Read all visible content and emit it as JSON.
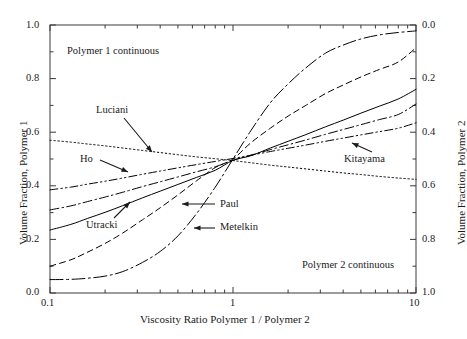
{
  "chart_data": {
    "type": "line",
    "title": "",
    "xlabel": "Viscosity Ratio Polymer 1 / Polymer 2",
    "ylabel": "Volume Fraction, Polymer 1",
    "y2label": "Volume Fraction, Polymer 2",
    "xscale": "log",
    "xlim": [
      0.1,
      10
    ],
    "ylim": [
      0.0,
      1.0
    ],
    "y2lim": [
      1.0,
      0.0
    ],
    "grid": false,
    "legend_position": "inline-annotations",
    "xticks": [
      "0.1",
      "1",
      "10"
    ],
    "xtick_values": [
      0.1,
      1,
      10
    ],
    "yticks": [
      "0.0",
      "0.2",
      "0.4",
      "0.6",
      "0.8",
      "1.0"
    ],
    "ytick_values": [
      0.0,
      0.2,
      0.4,
      0.6,
      0.8,
      1.0
    ],
    "y2ticks": [
      "0.0",
      "0.2",
      "0.4",
      "0.6",
      "0.8",
      "1.0"
    ],
    "y2tick_values": [
      0.0,
      0.2,
      0.4,
      0.6,
      0.8,
      1.0
    ],
    "x": [
      0.1,
      0.13,
      0.16,
      0.2,
      0.25,
      0.32,
      0.4,
      0.5,
      0.63,
      0.8,
      1.0,
      1.25,
      1.6,
      2.0,
      2.5,
      3.2,
      4.0,
      5.0,
      6.3,
      8.0,
      10.0
    ],
    "series": [
      {
        "name": "Luciani",
        "style": "dotted",
        "values": [
          0.57,
          0.563,
          0.556,
          0.549,
          0.541,
          0.532,
          0.524,
          0.516,
          0.508,
          0.501,
          0.494,
          0.486,
          0.477,
          0.47,
          0.463,
          0.455,
          0.448,
          0.442,
          0.435,
          0.429,
          0.424
        ]
      },
      {
        "name": "Ho",
        "style": "dash-dot-dot",
        "values": [
          0.385,
          0.395,
          0.406,
          0.417,
          0.429,
          0.443,
          0.455,
          0.467,
          0.479,
          0.491,
          0.502,
          0.514,
          0.528,
          0.54,
          0.552,
          0.566,
          0.578,
          0.59,
          0.602,
          0.615,
          0.635
        ]
      },
      {
        "name": "Kitayama",
        "style": "dash-dot",
        "values": [
          0.31,
          0.325,
          0.341,
          0.358,
          0.376,
          0.397,
          0.415,
          0.433,
          0.452,
          0.471,
          0.495,
          0.514,
          0.535,
          0.553,
          0.571,
          0.592,
          0.61,
          0.628,
          0.647,
          0.666,
          0.705
        ]
      },
      {
        "name": "Utracki",
        "style": "solid",
        "values": [
          0.235,
          0.256,
          0.278,
          0.301,
          0.326,
          0.355,
          0.38,
          0.405,
          0.431,
          0.458,
          0.495,
          0.512,
          0.541,
          0.566,
          0.591,
          0.62,
          0.645,
          0.671,
          0.697,
          0.724,
          0.76
        ]
      },
      {
        "name": "Paul",
        "style": "dashed",
        "values": [
          0.1,
          0.124,
          0.152,
          0.185,
          0.224,
          0.273,
          0.318,
          0.366,
          0.418,
          0.468,
          0.5,
          0.56,
          0.615,
          0.66,
          0.7,
          0.744,
          0.776,
          0.806,
          0.834,
          0.862,
          0.915
        ]
      },
      {
        "name": "Metelkin",
        "style": "long-dash-dot",
        "values": [
          0.05,
          0.051,
          0.055,
          0.063,
          0.08,
          0.114,
          0.155,
          0.213,
          0.295,
          0.395,
          0.5,
          0.605,
          0.71,
          0.78,
          0.84,
          0.895,
          0.925,
          0.948,
          0.963,
          0.972,
          0.978
        ]
      }
    ],
    "annotations": [
      {
        "name": "Polymer 1 continuous",
        "text": "Polymer 1 continuous"
      },
      {
        "name": "Polymer 2 continuous",
        "text": "Polymer 2 continuous"
      },
      {
        "name": "Luciani",
        "text": "Luciani"
      },
      {
        "name": "Ho",
        "text": "Ho"
      },
      {
        "name": "Utracki",
        "text": "Utracki"
      },
      {
        "name": "Paul",
        "text": "Paul"
      },
      {
        "name": "Metelkin",
        "text": "Metelkin"
      },
      {
        "name": "Kitayama",
        "text": "Kitayama"
      }
    ],
    "colors": {
      "lines": "#000000",
      "axes": "#3a3a3a",
      "text": "#1a1a1a",
      "background": "#ffffff"
    }
  },
  "axis": {
    "left_title": "Volume Fraction, Polymer 1",
    "right_title": "Volume Fraction, Polymer 2",
    "bottom_title": "Viscosity Ratio Polymer 1 / Polymer 2",
    "left_ticks": [
      "1.0",
      "0.8",
      "0.6",
      "0.4",
      "0.2",
      "0.0"
    ],
    "right_ticks": [
      "0.0",
      "0.2",
      "0.4",
      "0.6",
      "0.8",
      "1.0"
    ],
    "bottom_ticks": [
      "0.1",
      "1",
      "10"
    ]
  },
  "labels": {
    "region_top": "Polymer 1 continuous",
    "region_bottom": "Polymer 2 continuous",
    "luciani": "Luciani",
    "ho": "Ho",
    "utracki": "Utracki",
    "paul": "Paul",
    "metelkin": "Metelkin",
    "kitayama": "Kitayama"
  }
}
